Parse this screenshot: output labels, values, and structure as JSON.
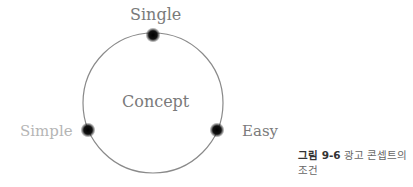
{
  "diagram": {
    "center_label": "Concept",
    "nodes": [
      {
        "label": "Single",
        "position": "top"
      },
      {
        "label": "Simple",
        "position": "left"
      },
      {
        "label": "Easy",
        "position": "right"
      }
    ],
    "colors": {
      "circle": "#8a8a8a",
      "node": "#111111",
      "label": "#7a7a7a",
      "label_faded": "#b5b5b5"
    }
  },
  "caption": {
    "figure_number": "그림 9-6",
    "text": "광고 콘셉트의 조건"
  }
}
